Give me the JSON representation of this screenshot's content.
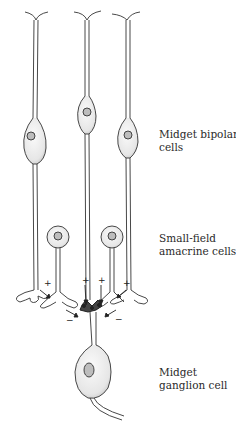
{
  "figure": {
    "colors": {
      "background": "#ffffff",
      "line": "#333333",
      "cell_fill": "#f3f3f3",
      "nucleus_fill": "#bdbdbd",
      "text": "#2a2a2a"
    }
  },
  "labels": {
    "bipolar": {
      "line1": "Midget bipolar",
      "line2": "cells"
    },
    "amacrine": {
      "line1": "Small-field",
      "line2": "amacrine cells"
    },
    "ganglion": {
      "line1": "Midget",
      "line2": "ganglion cell"
    }
  },
  "synapse_signs": {
    "excitatory": [
      "+",
      "+",
      "+",
      "+"
    ],
    "inhibitory": [
      "−",
      "−"
    ]
  },
  "cells": {
    "bipolar_count": 3,
    "amacrine_count": 2,
    "ganglion_count": 1
  }
}
